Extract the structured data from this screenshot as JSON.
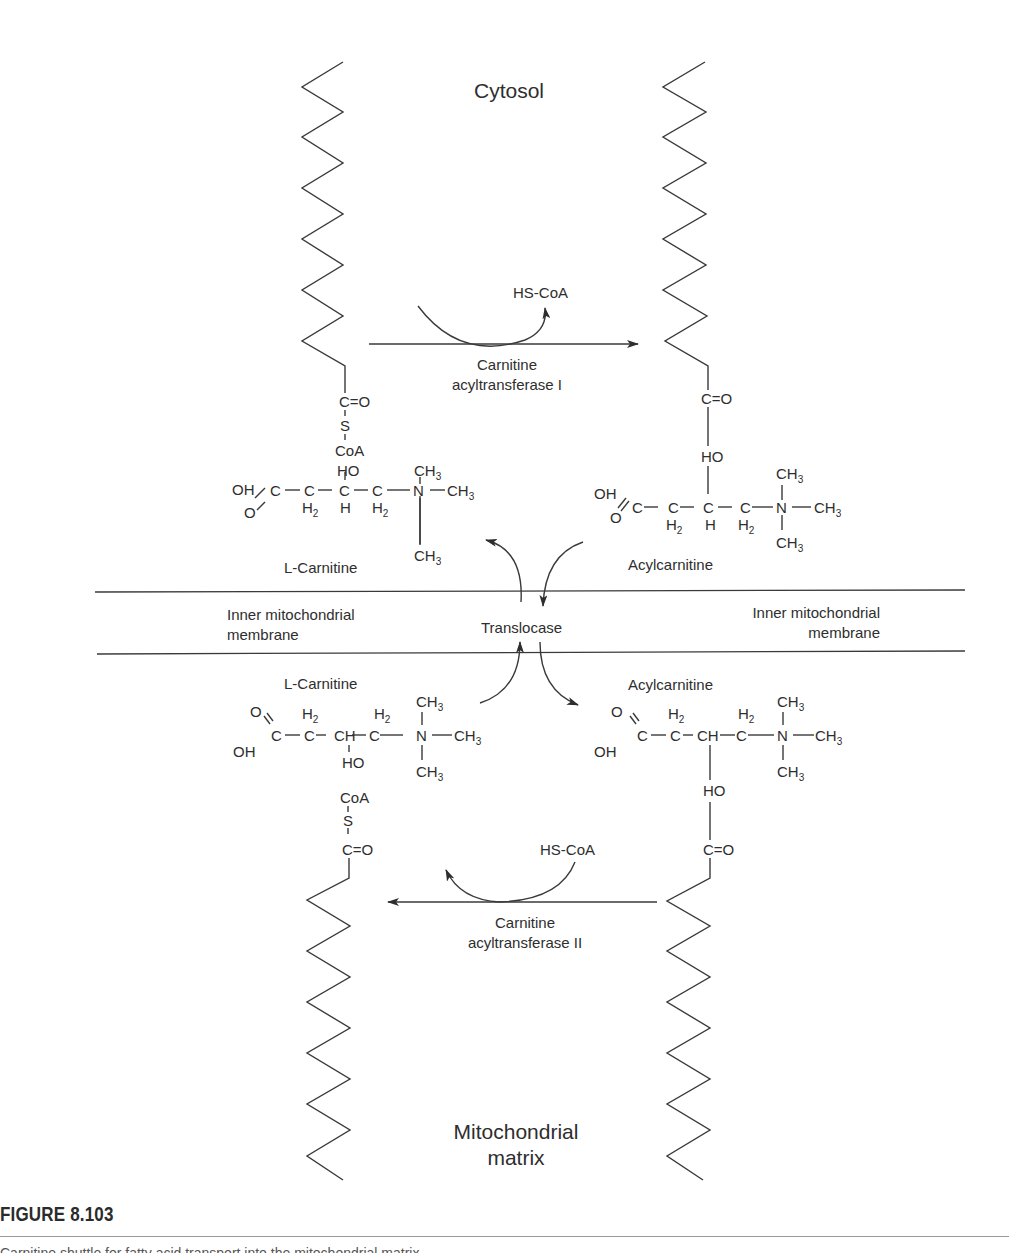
{
  "regions": {
    "top": "Cytosol",
    "bottom_line1": "Mitochondrial",
    "bottom_line2": "matrix"
  },
  "membrane": {
    "left_line1": "Inner mitochondrial",
    "left_line2": "membrane",
    "right_line1": "Inner mitochondrial",
    "right_line2": "membrane",
    "transporter": "Translocase"
  },
  "reactions": {
    "cat1": {
      "line1": "Carnitine",
      "line2": "acyltransferase I",
      "byproduct": "HS-CoA"
    },
    "cat2": {
      "line1": "Carnitine",
      "line2": "acyltransferase II",
      "byproduct": "HS-CoA"
    }
  },
  "molecules": {
    "cytosol_carnitine_name": "L-Carnitine",
    "cytosol_acylcarnitine_name": "Acylcarnitine",
    "matrix_carnitine_name": "L-Carnitine",
    "matrix_acylcarnitine_name": "Acylcarnitine",
    "acyl_coa_thioester": {
      "carbonyl": "C=O",
      "sulfur": "S",
      "coa": "CoA"
    },
    "atoms": {
      "C": "C",
      "O": "O",
      "OH": "OH",
      "HO": "HO",
      "H": "H",
      "N": "N",
      "CH": "CH",
      "CH3": "CH",
      "CH3_sub": "3",
      "H2": "H",
      "H2_sub": "2"
    }
  },
  "figure": {
    "label": "FIGURE 8.103",
    "caption": "Carnitine shuttle for fatty acid transport into the mitochondrial matrix."
  }
}
